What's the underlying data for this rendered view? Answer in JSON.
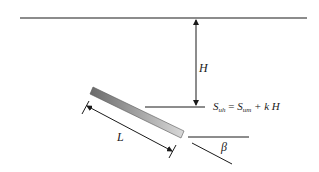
{
  "diagram": {
    "labels": {
      "height": "H",
      "length": "L",
      "angle": "β",
      "formula": {
        "lhs_base": "S",
        "lhs_sub": "uh",
        "equals": " = ",
        "rhs_base": "S",
        "rhs_sub": "um",
        "rhs_rest": " + k H"
      }
    },
    "colors": {
      "line": "#1a1a1a",
      "bar_dark": "#6a6a6a",
      "bar_light": "#d6d6d6",
      "bar_edge": "#555555"
    }
  }
}
